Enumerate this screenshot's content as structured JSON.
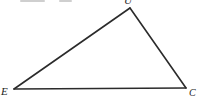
{
  "figure": {
    "type": "geometry-triangle",
    "background": "#ffffff",
    "line_color": "#2b2b2b",
    "line_width": 1.6,
    "vertices": [
      {
        "id": "U",
        "label": "U",
        "x": 130,
        "y": 8,
        "label_x": 124,
        "label_y": -5,
        "label_size": 11,
        "clipped_at_top": true
      },
      {
        "id": "E",
        "label": "E",
        "x": 14,
        "y": 89,
        "label_x": 1,
        "label_y": 86,
        "label_size": 11,
        "clipped_at_top": false
      },
      {
        "id": "C",
        "label": "C",
        "x": 186,
        "y": 88,
        "label_x": 189,
        "label_y": 88,
        "label_size": 10,
        "clipped_at_top": false
      }
    ],
    "edges": [
      [
        "E",
        "U"
      ],
      [
        "U",
        "C"
      ],
      [
        "C",
        "E"
      ]
    ],
    "top_edge_text_remnants": {
      "color": "#a8a8a8",
      "marks": [
        {
          "x": 20,
          "y": 0,
          "w": 25,
          "h": 2
        },
        {
          "x": 59,
          "y": 0,
          "w": 13,
          "h": 2
        }
      ]
    }
  }
}
